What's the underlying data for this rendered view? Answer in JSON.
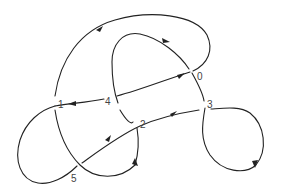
{
  "diagram": {
    "type": "knot-diagram",
    "stroke_color": "#222222",
    "label_color": "#444444",
    "crossings": [
      {
        "label": "0",
        "x": 198,
        "y": 71
      },
      {
        "label": "1",
        "x": 56,
        "y": 104
      },
      {
        "label": "2",
        "x": 141,
        "y": 122
      },
      {
        "label": "3",
        "x": 208,
        "y": 102
      },
      {
        "label": "4",
        "x": 110,
        "y": 99
      },
      {
        "label": "5",
        "x": 72,
        "y": 177
      }
    ],
    "arrow_icons": [
      "arrow-outer-arc",
      "arrow-inner-arc",
      "arrow-strand-0",
      "arrow-strand-1",
      "arrow-strand-2",
      "arrow-strand-5",
      "arrow-loop-3",
      "arrow-descending-2"
    ]
  }
}
